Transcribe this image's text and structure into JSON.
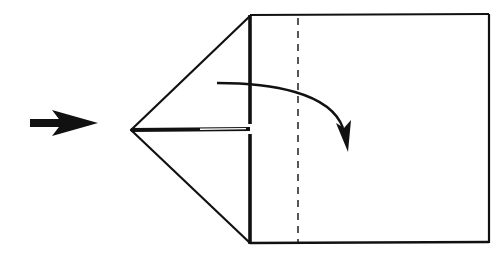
{
  "diagram": {
    "type": "origami-fold-step",
    "colors": {
      "ink": "#111111",
      "paper": "#ffffff"
    },
    "elements": {
      "push_arrow": {
        "icon": "push-arrow-icon",
        "direction": "right"
      },
      "triangle_flap": {
        "apex": [
          131,
          130
        ],
        "top": [
          250,
          16
        ],
        "bottom": [
          250,
          243
        ]
      },
      "square_paper": {
        "left": 250,
        "top": 15,
        "right": 489,
        "bottom": 243
      },
      "valley_fold_line": {
        "style": "dashed",
        "x": 298
      },
      "center_crease": {
        "style": "double-line",
        "y": 129
      },
      "fold_arrow": {
        "icon": "curved-fold-arrow-icon",
        "direction": "clockwise-down"
      }
    }
  }
}
